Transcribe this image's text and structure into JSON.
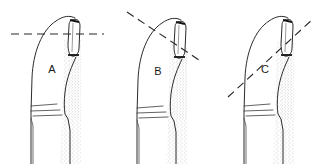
{
  "figure": {
    "background_color": "#ffffff",
    "ink_color": "#2b2b2b",
    "width": 316,
    "height": 164,
    "panel_count": 3,
    "style": "line-drawing"
  },
  "panels": [
    {
      "id": "A",
      "label": "A",
      "label_x": 52,
      "label_y": 70,
      "description": "Finger in profile with horizontal reference line across the fingertip",
      "line": {
        "name": "horizontal-axis-line",
        "orientation": "horizontal",
        "angle_degrees": 0,
        "x1": 11,
        "y1": 34,
        "x2": 104,
        "y2": 34,
        "dash": "8 5"
      }
    },
    {
      "id": "B",
      "label": "B",
      "label_x": 158,
      "label_y": 72,
      "description": "Finger in profile with reference line sloping downward to the right",
      "line": {
        "name": "downward-axis-line",
        "orientation": "descending",
        "angle_degrees": -35,
        "x1": 127,
        "y1": 12,
        "x2": 202,
        "y2": 62,
        "dash": "8 5"
      }
    },
    {
      "id": "C",
      "label": "C",
      "label_x": 265,
      "label_y": 70,
      "description": "Finger in profile with reference line sloping upward to the right",
      "line": {
        "name": "upward-axis-line",
        "orientation": "ascending",
        "angle_degrees": 38,
        "x1": 228,
        "y1": 97,
        "x2": 314,
        "y2": 18,
        "dash": "8 5"
      }
    }
  ],
  "colors": {
    "ink": "#2b2b2b",
    "soft_ink": "#4a4a4a",
    "nail_base": "#111111",
    "stipple": "#8d8d8d",
    "background": "#ffffff",
    "label_text": "#1a1a1a"
  }
}
